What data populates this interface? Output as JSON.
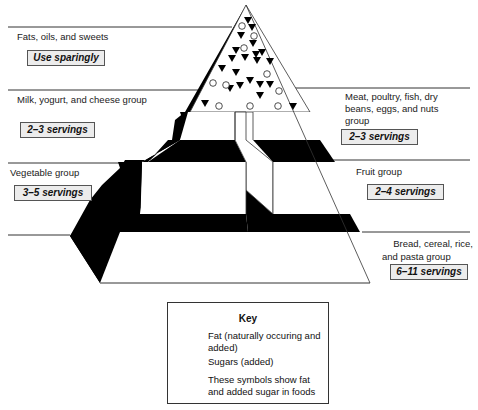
{
  "groups": {
    "fats": {
      "label": "Fats, oils, and sweets",
      "servings": "Use sparingly"
    },
    "milk": {
      "label": "Milk, yogurt, and cheese group",
      "servings": "2–3 servings"
    },
    "meat": {
      "label_lines": [
        "Meat, poultry, fish, dry",
        "beans, eggs, and nuts",
        "group"
      ],
      "servings": "2–3 servings"
    },
    "vegetable": {
      "label": "Vegetable group",
      "servings": "3–5 servings"
    },
    "fruit": {
      "label": "Fruit group",
      "servings": "2–4 servings"
    },
    "bread": {
      "label_lines": [
        "Bread, cereal, rice,",
        "and  pasta group"
      ],
      "servings": "6–11 servings"
    }
  },
  "key": {
    "title": "Key",
    "fat_lines": [
      "Fat (naturally occuring and",
      "added)"
    ],
    "sugar": "Sugars (added)",
    "note_lines": [
      "These symbols show fat",
      "and added sugar in foods"
    ],
    "fat_icon": "circle-icon",
    "sugar_icon": "triangle-down-icon"
  },
  "colors": {
    "shadow": "#000000",
    "line": "#333333",
    "serving_box_bg": "#ececec",
    "fat_key": "#9a9a9a"
  }
}
